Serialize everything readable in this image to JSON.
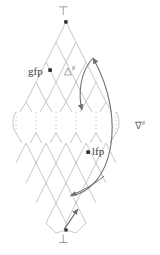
{
  "figure": {
    "type": "lattice-hasse-diagram",
    "width": 160,
    "height": 255,
    "background": "#ffffff"
  },
  "labels": {
    "top": "⊤",
    "bottom": "⊥",
    "gfp": "gfp",
    "lfp": "lfp",
    "widening_base": "△",
    "widening_sup": "♯",
    "narrowing_base": "∇",
    "narrowing_sup": "♯"
  },
  "colors": {
    "lattice_line": "#b9b9b9",
    "dotted_line": "#bdbdbd",
    "arrow": "#6f6f6f",
    "node_fill": "#2b2b2b",
    "text_dark": "#3a3a3a",
    "text_mid": "#6b6b6b",
    "text_light": "#8c8c8c"
  },
  "nodes": {
    "top": {
      "x": 66,
      "y": 22
    },
    "bottom": {
      "x": 66,
      "y": 230
    },
    "gfp": {
      "x": 50,
      "y": 70
    },
    "lfp": {
      "x": 88,
      "y": 152
    }
  },
  "lattice": {
    "columns": 6,
    "cell_width": 20,
    "cell_height": 20,
    "origin_x": 66,
    "upper_rows": 4,
    "lower_rows": 4,
    "dotted_gap_top": 112,
    "dotted_gap_bottom": 133
  },
  "arrows": {
    "inner": {
      "name": "narrowing-inner-arc",
      "from": {
        "x": 93,
        "y": 58
      },
      "to": {
        "x": 83,
        "y": 112
      }
    },
    "outer": {
      "name": "narrowing-outer-arc",
      "from": {
        "x": 70,
        "y": 195
      },
      "to": {
        "x": 93,
        "y": 58
      }
    },
    "widening": {
      "name": "widening-arc",
      "from": {
        "x": 66,
        "y": 230
      },
      "to": {
        "x": 78,
        "y": 208
      }
    }
  }
}
